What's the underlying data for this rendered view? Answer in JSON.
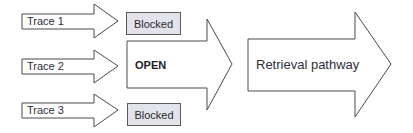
{
  "diagram": {
    "colors": {
      "stroke": "#4a4a4a",
      "arrow_fill": "#ffffff",
      "blocked_fill": "#e3e3ea",
      "text": "#2e2e38"
    },
    "traces": [
      {
        "label": "Trace 1",
        "status": "Blocked"
      },
      {
        "label": "Trace 2",
        "status": "OPEN"
      },
      {
        "label": "Trace 3",
        "status": "Blocked"
      }
    ],
    "retrieval": {
      "label": "Retrieval pathway"
    }
  },
  "geometry": {
    "trace_arrows": [
      {
        "x0": 22,
        "shaft_top": 14,
        "shaft_bottom": 29,
        "head_x": 94,
        "head_top": 4,
        "head_bottom": 38,
        "tip_x": 118,
        "tip_y": 21,
        "label_x": 27,
        "label_y": 16
      },
      {
        "x0": 22,
        "shaft_top": 59,
        "shaft_bottom": 74,
        "head_x": 94,
        "head_top": 50,
        "head_bottom": 83,
        "tip_x": 118,
        "tip_y": 66,
        "label_x": 27,
        "label_y": 61
      },
      {
        "x0": 22,
        "shaft_top": 103,
        "shaft_bottom": 118,
        "head_x": 94,
        "head_top": 94,
        "head_bottom": 127,
        "tip_x": 118,
        "tip_y": 110,
        "label_x": 27,
        "label_y": 105
      }
    ],
    "open_arrow": {
      "x0": 127,
      "shaft_top": 41,
      "shaft_bottom": 88,
      "head_x": 207,
      "head_top": 19,
      "head_bottom": 110,
      "tip_x": 232,
      "tip_y": 64,
      "label_x": 135,
      "label_y": 60
    },
    "retrieval_arrow": {
      "x0": 248,
      "shaft_top": 39,
      "shaft_bottom": 91,
      "head_x": 355,
      "head_top": 12,
      "head_bottom": 117,
      "tip_x": 391,
      "tip_y": 64,
      "label_x": 256,
      "label_y": 58
    },
    "blocked_boxes": [
      {
        "x": 126,
        "y": 12,
        "w": 55,
        "h": 23
      },
      {
        "x": 127,
        "y": 103,
        "w": 54,
        "h": 23
      }
    ]
  }
}
